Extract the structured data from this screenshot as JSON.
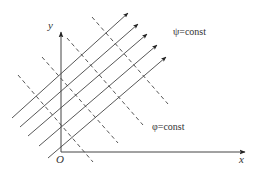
{
  "diagram": {
    "colors": {
      "line": "#444444",
      "text": "#333333",
      "background": "#ffffff"
    },
    "axes": {
      "origin_label": "O",
      "x_label": "x",
      "y_label": "y",
      "origin": [
        61,
        152
      ],
      "x_end": [
        245,
        152
      ],
      "y_end": [
        61,
        32
      ]
    },
    "labels": {
      "streamline": "ψ=const",
      "equipotential": "φ=const"
    },
    "streamlines": [
      {
        "from": [
          12,
          118
        ],
        "to": [
          128,
          13
        ]
      },
      {
        "from": [
          20,
          127
        ],
        "to": [
          138,
          24
        ]
      },
      {
        "from": [
          28,
          136
        ],
        "to": [
          147,
          34
        ]
      },
      {
        "from": [
          39,
          146
        ],
        "to": [
          157,
          45
        ]
      },
      {
        "from": [
          48,
          158
        ],
        "to": [
          166,
          57
        ]
      }
    ],
    "equipotentials": [
      {
        "from": [
          18,
          75
        ],
        "to": [
          93,
          162
        ]
      },
      {
        "from": [
          42,
          57
        ],
        "to": [
          118,
          143
        ]
      },
      {
        "from": [
          67,
          38
        ],
        "to": [
          143,
          125
        ]
      },
      {
        "from": [
          92,
          17
        ],
        "to": [
          168,
          104
        ]
      }
    ]
  }
}
